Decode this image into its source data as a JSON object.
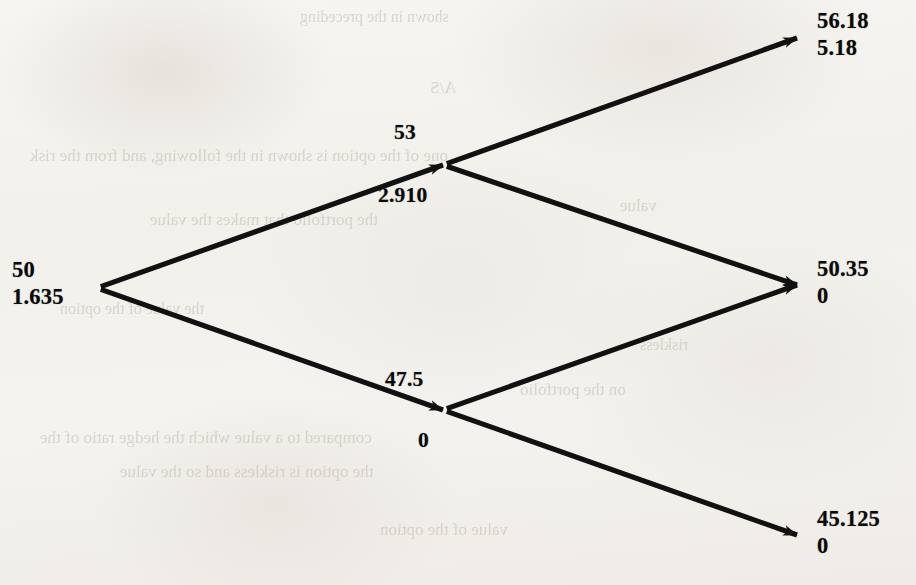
{
  "diagram": {
    "type": "binomial-option-pricing-tree",
    "steps": 2,
    "line_color": "#111111",
    "paper_color": "#f4f2ee",
    "text_color": "#0a0a0a"
  },
  "nodes": {
    "root": {
      "id": "root",
      "asset_price": "50",
      "option_value": "1.635",
      "x": 97,
      "y": 288
    },
    "up": {
      "id": "up",
      "asset_price": "53",
      "option_value": "2.910",
      "x": 443,
      "y": 165
    },
    "down": {
      "id": "down",
      "asset_price": "47.5",
      "option_value": "0",
      "x": 443,
      "y": 410
    },
    "up_up": {
      "id": "up-up",
      "asset_price": "56.18",
      "option_value": "5.18",
      "x": 797,
      "y": 38
    },
    "up_down": {
      "id": "up-down",
      "asset_price": "50.35",
      "option_value": "0",
      "x": 797,
      "y": 285
    },
    "down_down": {
      "id": "down-down",
      "asset_price": "45.125",
      "option_value": "0",
      "x": 797,
      "y": 535
    }
  },
  "edges": [
    {
      "id": "root-up",
      "from": "root",
      "to": "up"
    },
    {
      "id": "root-down",
      "from": "root",
      "to": "down"
    },
    {
      "id": "up-upup",
      "from": "up",
      "to": "up_up"
    },
    {
      "id": "up-updown",
      "from": "up",
      "to": "up_down"
    },
    {
      "id": "down-updown",
      "from": "down",
      "to": "up_down"
    },
    {
      "id": "down-downdown",
      "from": "down",
      "to": "down_down"
    }
  ],
  "background_bleed": [
    {
      "text": "shown in the preceding",
      "x": 300,
      "y": 8,
      "size": 16
    },
    {
      "text": "A/S",
      "x": 430,
      "y": 78,
      "size": 17
    },
    {
      "text": "one of the option is shown in the following, and from the risk",
      "x": 30,
      "y": 146,
      "size": 17
    },
    {
      "text": "the portfolio that makes the value",
      "x": 150,
      "y": 210,
      "size": 17
    },
    {
      "text": "value",
      "x": 620,
      "y": 196,
      "size": 17
    },
    {
      "text": "the value of the option",
      "x": 60,
      "y": 300,
      "size": 16
    },
    {
      "text": "riskless",
      "x": 640,
      "y": 336,
      "size": 16
    },
    {
      "text": "on the portfolio",
      "x": 520,
      "y": 380,
      "size": 17
    },
    {
      "text": "compared to a value which the hedge ratio of the",
      "x": 40,
      "y": 428,
      "size": 17
    },
    {
      "text": "the option is riskless and so the value",
      "x": 120,
      "y": 462,
      "size": 17
    },
    {
      "text": "value of the option",
      "x": 380,
      "y": 520,
      "size": 17
    }
  ]
}
